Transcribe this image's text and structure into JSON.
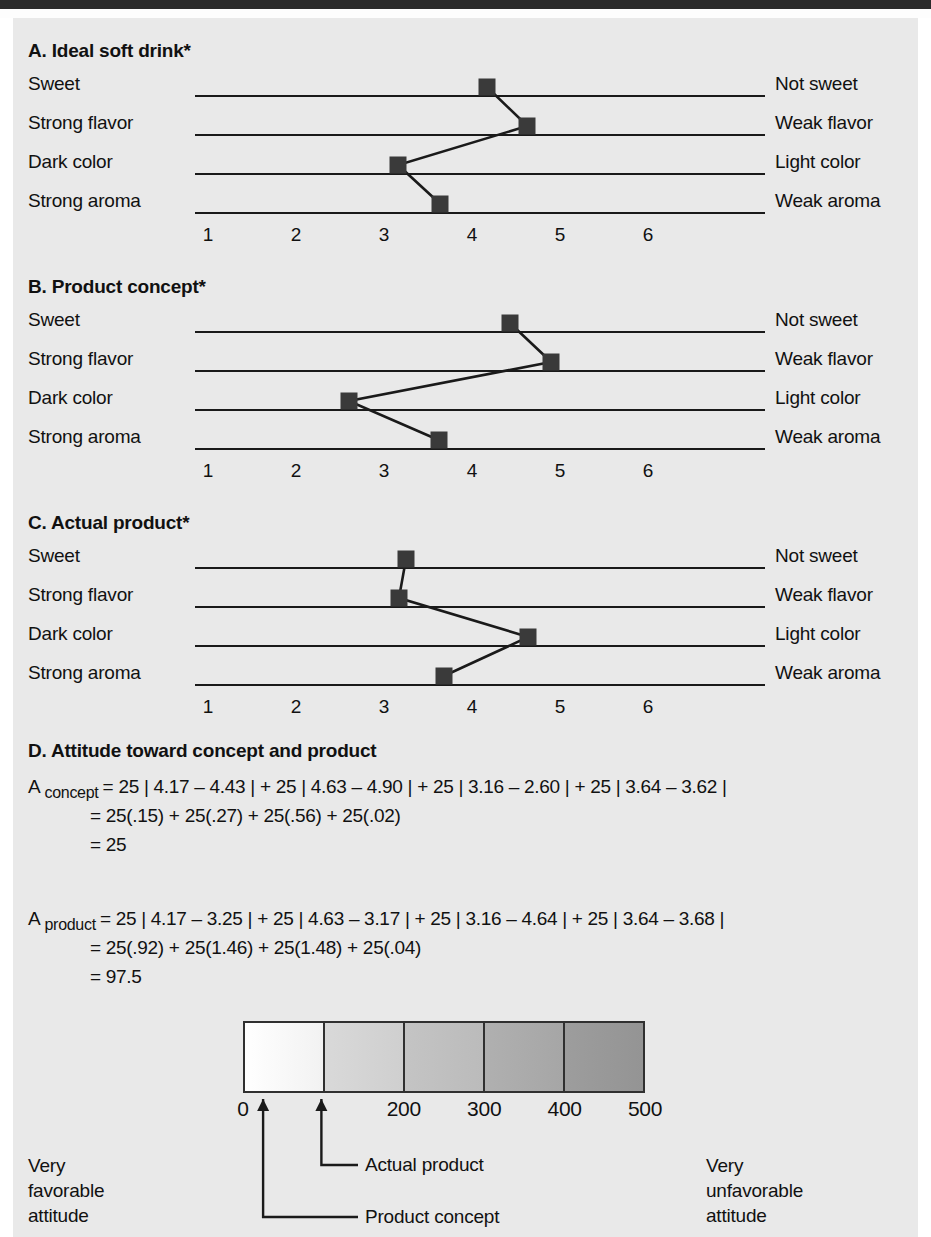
{
  "theme": {
    "page_bg": "#e9e9e9",
    "ink": "#111111",
    "marker_color": "#3a3a3a",
    "line_color": "#1a1a1a",
    "header_bar": "#2b2b2b"
  },
  "axis": {
    "ticks": [
      "1",
      "2",
      "3",
      "4",
      "5",
      "6"
    ],
    "min": 1,
    "max": 6
  },
  "attributes": [
    {
      "left": "Sweet",
      "right": "Not sweet"
    },
    {
      "left": "Strong flavor",
      "right": "Weak flavor"
    },
    {
      "left": "Dark color",
      "right": "Light color"
    },
    {
      "left": "Strong aroma",
      "right": "Weak aroma"
    }
  ],
  "panels": [
    {
      "id": "A",
      "title": "A. Ideal soft drink*",
      "values": [
        4.17,
        4.63,
        3.16,
        3.64
      ]
    },
    {
      "id": "B",
      "title": "B. Product concept*",
      "values": [
        4.43,
        4.9,
        2.6,
        3.62
      ]
    },
    {
      "id": "C",
      "title": "C. Actual product*",
      "values": [
        3.25,
        3.17,
        4.64,
        3.68
      ]
    }
  ],
  "sectionD": {
    "title": "D. Attitude toward concept and product",
    "equations": [
      {
        "symbol": "A",
        "subscript": "concept",
        "line1": "= 25 | 4.17 – 4.43 | + 25 | 4.63 – 4.90 | + 25 | 3.16 – 2.60 | + 25 | 3.64 – 3.62 |",
        "line2": "= 25(.15) + 25(.27) + 25(.56) + 25(.02)",
        "line3": "= 25"
      },
      {
        "symbol": "A",
        "subscript": "product",
        "line1": "= 25 | 4.17 – 3.25 | + 25 | 4.63 – 3.17 | + 25 | 3.16 – 4.64 | + 25 | 3.64 – 3.68 |",
        "line2": "= 25(.92) + 25(1.46) + 25(1.48) + 25(.04)",
        "line3": "= 97.5"
      }
    ]
  },
  "scale": {
    "segments": [
      {
        "from": "#ffffff",
        "to": "#f2f2f2"
      },
      {
        "from": "#d9d9d9",
        "to": "#cfcfcf"
      },
      {
        "from": "#c4c4c4",
        "to": "#bbbbbb"
      },
      {
        "from": "#b0b0b0",
        "to": "#a6a6a6"
      },
      {
        "from": "#9d9d9d",
        "to": "#949494"
      }
    ],
    "tick_labels": [
      "0",
      "200",
      "300",
      "400",
      "500"
    ],
    "tick_values": [
      0,
      200,
      300,
      400,
      500
    ],
    "min": 0,
    "max": 500,
    "markers": [
      {
        "name": "Product concept",
        "value": 25
      },
      {
        "name": "Actual product",
        "value": 97.5
      }
    ],
    "left_note": "Very\nfavorable\nattitude",
    "right_note": "Very\nunfavorable\nattitude"
  },
  "chart_data": {
    "type": "line",
    "xlabel": "",
    "ylabel": "",
    "xlim": [
      1,
      6
    ],
    "grid": false,
    "legend": "none",
    "categories": [
      "Sweet / Not sweet",
      "Strong flavor / Weak flavor",
      "Dark color / Light color",
      "Strong aroma / Weak aroma"
    ],
    "series": [
      {
        "name": "A. Ideal soft drink",
        "values": [
          4.17,
          4.63,
          3.16,
          3.64
        ]
      },
      {
        "name": "B. Product concept",
        "values": [
          4.43,
          4.9,
          2.6,
          3.62
        ]
      },
      {
        "name": "C. Actual product",
        "values": [
          3.25,
          3.17,
          4.64,
          3.68
        ]
      }
    ],
    "annotations": [
      "A concept = 25 | 4.17 - 4.43 | + 25 | 4.63 - 4.90 | + 25 | 3.16 - 2.60 | + 25 | 3.64 - 3.62 | = 25",
      "A product = 25 | 4.17 - 3.25 | + 25 | 4.63 - 3.17 | + 25 | 3.16 - 4.64 | + 25 | 3.64 - 3.68 | = 97.5"
    ]
  }
}
